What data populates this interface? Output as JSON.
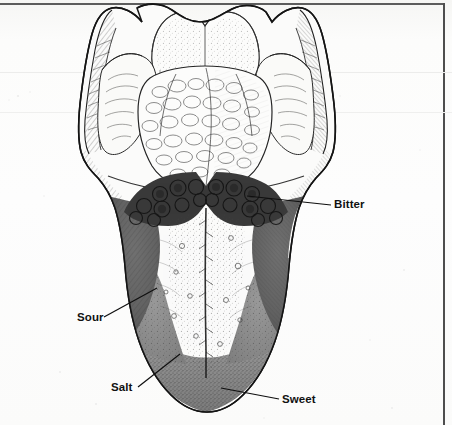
{
  "figure": {
    "type": "anatomical-illustration",
    "labels": [
      {
        "id": "bitter",
        "text": "Bitter",
        "region": "posterior-tongue-circumvallate-papillae",
        "shading": "darkest"
      },
      {
        "id": "sour",
        "text": "Sour",
        "region": "lateral-margin-posterior",
        "shading": "dark-gray"
      },
      {
        "id": "salt",
        "text": "Salt",
        "region": "lateral-margin-anterior",
        "shading": "mid-gray"
      },
      {
        "id": "sweet",
        "text": "Sweet",
        "region": "tongue-tip-apex",
        "shading": "mid-gray"
      }
    ],
    "colors": {
      "ink": "#111111",
      "paper": "#fdfdfc",
      "bitter_fill": "#3a3a3a",
      "sour_fill": "#6e6e6e",
      "salt_fill": "#8f8f8f",
      "sweet_fill": "#8a8a8a",
      "body_fill": "#fbfbfa",
      "border_rule": "#5c5c5c"
    }
  }
}
